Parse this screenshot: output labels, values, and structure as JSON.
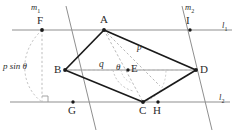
{
  "figure": {
    "type": "geometry-diagram",
    "width": 237,
    "height": 136,
    "colors": {
      "solid_stroke": "#1a1a1a",
      "thin_stroke": "#8a8a8a",
      "dashed_stroke": "#b0b0b0",
      "label_text": "#2b2b2b",
      "vertex_dot": "#1a1a1a"
    }
  },
  "labels": {
    "vertex_A": "A",
    "vertex_B": "B",
    "vertex_C": "C",
    "vertex_D": "D",
    "centre_E": "E",
    "point_F": "F",
    "point_G": "G",
    "point_H": "H",
    "point_I": "I",
    "line_l1": "l",
    "line_l1_sub": "1",
    "line_l2": "l",
    "line_l2_sub": "2",
    "line_m1": "m",
    "line_m1_sub": "1",
    "line_m2": "m",
    "line_m2_sub": "2",
    "measure_height": "p sin θ",
    "segment_p": "p",
    "segment_q": "q",
    "angle_theta": "θ"
  },
  "geometry": {
    "lines": {
      "l1": {
        "y": 30,
        "x_start": 12,
        "x_end": 232
      },
      "l2": {
        "y": 102,
        "x_start": 10,
        "x_end": 230
      },
      "m1": {
        "x_top": 66,
        "y_top": 6,
        "x_bottom": 96,
        "y_bottom": 130
      },
      "m2": {
        "x_top": 182,
        "y_top": 6,
        "x_bottom": 212,
        "y_bottom": 130
      }
    },
    "points": {
      "A": {
        "x": 104,
        "y": 30
      },
      "B": {
        "x": 65,
        "y": 70
      },
      "C": {
        "x": 143,
        "y": 102
      },
      "D": {
        "x": 196,
        "y": 70
      },
      "E": {
        "x": 128,
        "y": 70
      },
      "F": {
        "x": 42,
        "y": 30
      },
      "G": {
        "x": 73,
        "y": 102
      },
      "H": {
        "x": 158,
        "y": 102
      },
      "I": {
        "x": 190,
        "y": 30
      },
      "foot": {
        "x": 42,
        "y": 102
      }
    },
    "solid_edges": [
      [
        "A",
        "B"
      ],
      [
        "A",
        "D"
      ],
      [
        "B",
        "C"
      ],
      [
        "C",
        "D"
      ]
    ],
    "dashed_segments": [
      [
        "A",
        "C"
      ],
      [
        "B",
        "D"
      ],
      [
        "A",
        "D_inner"
      ],
      [
        "F",
        "foot"
      ]
    ],
    "right_angle_marker": {
      "x": 42,
      "y": 102,
      "size": 6
    }
  }
}
